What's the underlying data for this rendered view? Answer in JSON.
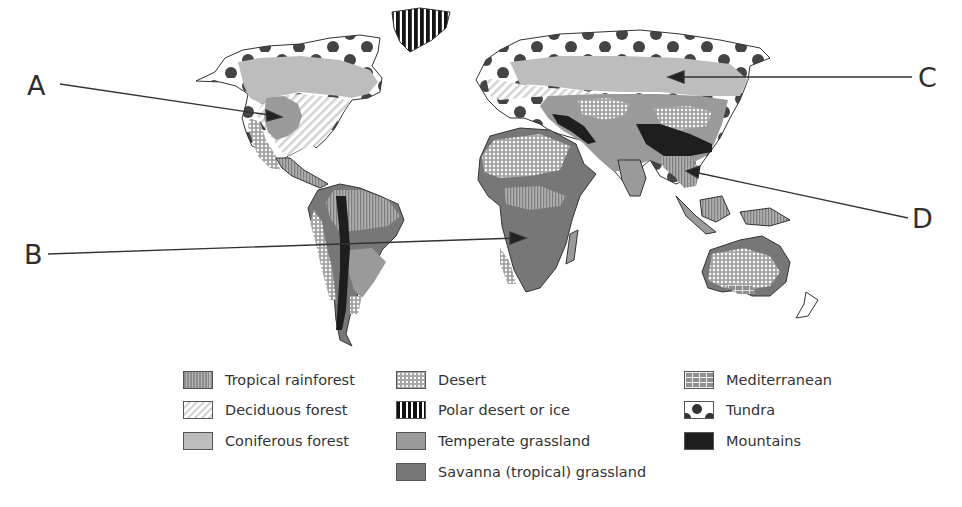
{
  "diagram": {
    "type": "world biome map",
    "callouts": [
      {
        "letter": "A",
        "target": "North American interior (temperate grassland region)"
      },
      {
        "letter": "B",
        "target": "Central/southern Africa (savanna region)"
      },
      {
        "letter": "C",
        "target": "Northern Asia / Siberia (coniferous forest region)"
      },
      {
        "letter": "D",
        "target": "Southeast Asia (tropical rainforest region)"
      }
    ]
  },
  "legend": {
    "columns": [
      [
        {
          "id": "tropical-rainforest",
          "label": "Tropical rainforest",
          "pattern": "fine vertical stripes, gray"
        },
        {
          "id": "deciduous-forest",
          "label": "Deciduous forest",
          "pattern": "light diagonal stripes"
        },
        {
          "id": "coniferous-forest",
          "label": "Coniferous forest",
          "pattern": "solid light gray"
        }
      ],
      [
        {
          "id": "desert",
          "label": "Desert",
          "pattern": "white dots on gray"
        },
        {
          "id": "polar-desert-ice",
          "label": "Polar desert or ice",
          "pattern": "bold black vertical stripes"
        },
        {
          "id": "temperate-grassland",
          "label": "Temperate grassland",
          "pattern": "solid medium gray"
        },
        {
          "id": "savanna",
          "label": "Savanna (tropical) grassland",
          "pattern": "solid dark gray"
        }
      ],
      [
        {
          "id": "mediterranean",
          "label": "Mediterranean",
          "pattern": "brick pattern"
        },
        {
          "id": "tundra",
          "label": "Tundra",
          "pattern": "large black dots on white"
        },
        {
          "id": "mountains",
          "label": "Mountains",
          "pattern": "solid black"
        }
      ]
    ]
  },
  "colors": {
    "background": "#ffffff",
    "coniferous": "#bdbdbd",
    "temperate": "#9a9a9a",
    "savanna": "#777777",
    "mountains": "#1e1e1e",
    "tundra_dot": "#444444",
    "outline": "#333333"
  }
}
